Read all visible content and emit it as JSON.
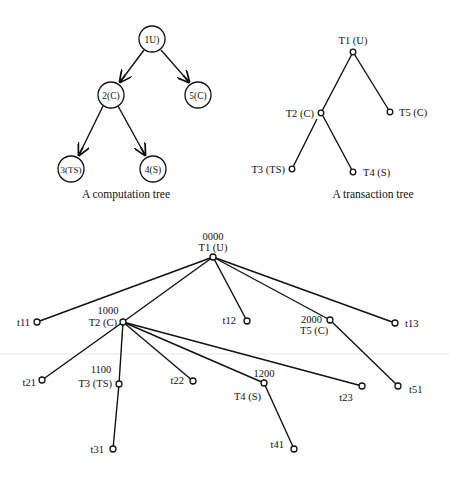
{
  "computation_tree": {
    "caption": "A computation tree",
    "nodes": [
      {
        "id": "1",
        "label": "1U)",
        "x": 152,
        "y": 39
      },
      {
        "id": "2",
        "label": "2(C)",
        "x": 111,
        "y": 95
      },
      {
        "id": "5",
        "label": "5(C)",
        "x": 198,
        "y": 95
      },
      {
        "id": "3",
        "label": "3(TS)",
        "x": 71,
        "y": 169
      },
      {
        "id": "4",
        "label": "4(S)",
        "x": 153,
        "y": 169
      }
    ],
    "edges": [
      [
        "1",
        "2"
      ],
      [
        "1",
        "5"
      ],
      [
        "2",
        "3"
      ],
      [
        "2",
        "4"
      ]
    ]
  },
  "transaction_tree": {
    "caption": "A transaction tree",
    "nodes": [
      {
        "id": "T1",
        "label": "T1 (U)",
        "x": 353,
        "y": 52
      },
      {
        "id": "T2",
        "label": "T2 (C)",
        "x": 321,
        "y": 113
      },
      {
        "id": "T5",
        "label": "T5 (C)",
        "x": 390,
        "y": 112
      },
      {
        "id": "T3",
        "label": "T3 (TS)",
        "x": 292,
        "y": 169
      },
      {
        "id": "T4",
        "label": "T4 (S)",
        "x": 353,
        "y": 172
      }
    ],
    "edges": [
      [
        "T1",
        "T2"
      ],
      [
        "T1",
        "T5"
      ],
      [
        "T2",
        "T3"
      ],
      [
        "T2",
        "T4"
      ]
    ]
  },
  "extended_tree": {
    "nodes": [
      {
        "id": "T1",
        "label": "T1 (U)",
        "code": "0000",
        "x": 213,
        "y": 257
      },
      {
        "id": "t11",
        "label": "t11",
        "x": 37,
        "y": 322
      },
      {
        "id": "T2",
        "label": "T2 (C)",
        "code": "1000",
        "x": 123,
        "y": 322
      },
      {
        "id": "t12",
        "label": "t12",
        "x": 247,
        "y": 321
      },
      {
        "id": "T5",
        "label": "T5 (C)",
        "code": "2000",
        "x": 330,
        "y": 320
      },
      {
        "id": "t13",
        "label": "t13",
        "x": 395,
        "y": 323
      },
      {
        "id": "t21",
        "label": "t21",
        "x": 42,
        "y": 380
      },
      {
        "id": "T3",
        "label": "T3 (TS)",
        "code": "1100",
        "x": 119,
        "y": 384
      },
      {
        "id": "t22",
        "label": "t22",
        "x": 193,
        "y": 381
      },
      {
        "id": "T4",
        "label": "T4 (S)",
        "code": "1200",
        "x": 264,
        "y": 383
      },
      {
        "id": "t23",
        "label": "t23",
        "x": 362,
        "y": 386
      },
      {
        "id": "t51",
        "label": "t51",
        "x": 398,
        "y": 386
      },
      {
        "id": "t31",
        "label": "t31",
        "x": 113,
        "y": 449
      },
      {
        "id": "t41",
        "label": "t41",
        "x": 294,
        "y": 449
      }
    ],
    "edges": [
      [
        "T1",
        "t11"
      ],
      [
        "T1",
        "T2"
      ],
      [
        "T1",
        "t12"
      ],
      [
        "T1",
        "T5"
      ],
      [
        "T1",
        "t13"
      ],
      [
        "T2",
        "t21"
      ],
      [
        "T2",
        "T3"
      ],
      [
        "T2",
        "t22"
      ],
      [
        "T2",
        "T4"
      ],
      [
        "T2",
        "t23"
      ],
      [
        "T5",
        "t51"
      ],
      [
        "T3",
        "t31"
      ],
      [
        "T4",
        "t41"
      ]
    ]
  }
}
